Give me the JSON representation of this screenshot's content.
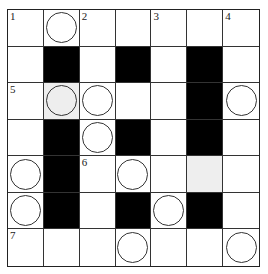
{
  "puzzle": {
    "type": "crossword",
    "rows": 7,
    "cols": 7,
    "colors": {
      "black": "#000000",
      "shade": "#eeeeee",
      "line": "#333333"
    },
    "cells": [
      [
        {
          "num": "1"
        },
        {
          "circle": true
        },
        {
          "num": "2"
        },
        {},
        {
          "num": "3"
        },
        {},
        {
          "num": "4"
        }
      ],
      [
        {},
        {
          "black": true
        },
        {},
        {
          "black": true
        },
        {},
        {
          "black": true
        },
        {}
      ],
      [
        {
          "num": "5"
        },
        {
          "circle": true,
          "shade": true
        },
        {
          "circle": true
        },
        {},
        {},
        {
          "black": true
        },
        {
          "circle": true
        }
      ],
      [
        {},
        {
          "black": true
        },
        {
          "circle": true
        },
        {
          "black": true
        },
        {},
        {
          "black": true
        },
        {}
      ],
      [
        {
          "circle": true
        },
        {
          "black": true
        },
        {
          "num": "6"
        },
        {
          "circle": true
        },
        {},
        {
          "shade": true
        },
        {}
      ],
      [
        {
          "circle": true
        },
        {
          "black": true
        },
        {},
        {
          "black": true
        },
        {
          "circle": true
        },
        {
          "black": true
        },
        {}
      ],
      [
        {
          "num": "7"
        },
        {},
        {},
        {
          "circle": true
        },
        {},
        {},
        {
          "circle": true
        }
      ]
    ]
  }
}
